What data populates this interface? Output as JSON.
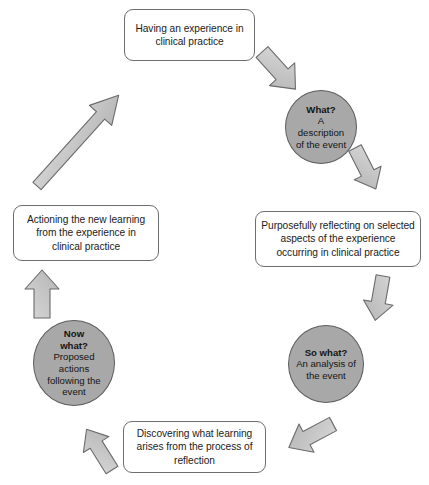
{
  "diagram": {
    "colors": {
      "background": "#ffffff",
      "circle_fill": "#a8a8a8",
      "circle_stroke": "#5d5d5d",
      "box_fill": "#ffffff",
      "box_stroke": "#6e6e6e",
      "arrow_fill": "#c6c6c6",
      "arrow_stroke": "#6b6b6b",
      "text": "#141414"
    },
    "boxes": [
      {
        "id": "experience",
        "text": "Having an experience in\nclinical practice"
      },
      {
        "id": "reflecting",
        "text": "Purposefully reflecting on selected\naspects of the experience\noccurring in clinical practice"
      },
      {
        "id": "discovering",
        "text": "Discovering what learning\narises from the process of\nreflection"
      },
      {
        "id": "actioning",
        "text": "Actioning the new learning\nfrom the experience in\nclinical practice"
      }
    ],
    "circles": [
      {
        "id": "what",
        "title": "What?",
        "body": "A\ndescription\nof the event"
      },
      {
        "id": "so-what",
        "title": "So what?",
        "body": "An analysis of\nthe event"
      },
      {
        "id": "now-what",
        "title": "Now\nwhat?",
        "body": "Proposed\nactions\nfollowing the\nevent"
      }
    ],
    "arrows": [
      {
        "id": "experience-to-what",
        "direction": "down-right",
        "style": "block"
      },
      {
        "id": "what-to-reflecting",
        "direction": "down-right",
        "style": "block"
      },
      {
        "id": "reflecting-to-so-what",
        "direction": "down",
        "style": "block"
      },
      {
        "id": "so-what-to-discovering",
        "direction": "down-left",
        "style": "block"
      },
      {
        "id": "discovering-to-now-what",
        "direction": "up-left",
        "style": "block"
      },
      {
        "id": "now-what-to-actioning",
        "direction": "up",
        "style": "block"
      },
      {
        "id": "actioning-to-experience",
        "direction": "up-right",
        "style": "long-thin"
      }
    ]
  }
}
